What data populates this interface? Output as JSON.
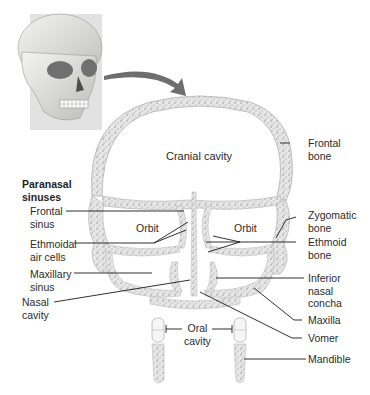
{
  "figure": {
    "inset": {
      "description": "skull-with-coronal-plane",
      "plane_color": "#dcdcdc",
      "arrow_color": "#6e6e6e"
    },
    "bone_fill": "#e4e4e4",
    "bone_stipple": "#8a8a8a",
    "leader_color": "#1a1a1a"
  },
  "sections": {
    "paranasal_title_line1": "Paranasal",
    "paranasal_title_line2": "sinuses"
  },
  "cavities": {
    "cranial": "Cranial cavity",
    "orbit_left": "Orbit",
    "orbit_right": "Orbit",
    "oral_line1": "Oral",
    "oral_line2": "cavity"
  },
  "labels_left": [
    {
      "line1": "Frontal",
      "line2": "sinus"
    },
    {
      "line1": "Ethmoidal",
      "line2": "air cells"
    },
    {
      "line1": "Maxillary",
      "line2": "sinus"
    },
    {
      "line1": "Nasal",
      "line2": "cavity"
    }
  ],
  "labels_right": [
    {
      "line1": "Frontal",
      "line2": "bone"
    },
    {
      "line1": "Zygomatic",
      "line2": "bone"
    },
    {
      "line1": "Ethmoid",
      "line2": "bone"
    },
    {
      "line1": "Inferior",
      "line2": "nasal",
      "line3": "concha"
    },
    {
      "line1": "Maxilla"
    },
    {
      "line1": "Vomer"
    },
    {
      "line1": "Mandible"
    }
  ]
}
